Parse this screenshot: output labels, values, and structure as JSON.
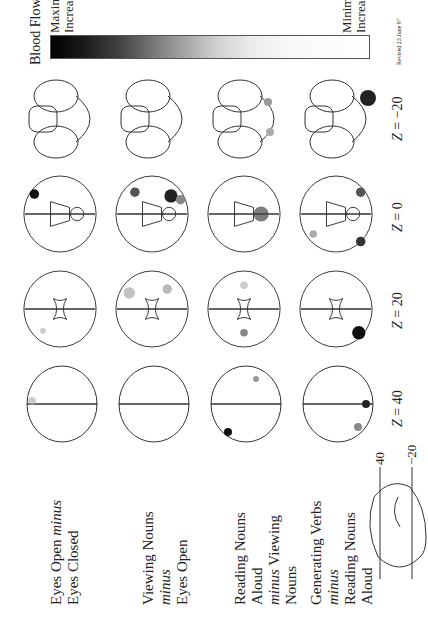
{
  "figure": {
    "orientation": "rotated -90 degrees on page",
    "conditions": [
      {
        "line1": "Eyes Open ",
        "line1_italic": "minus",
        "line2": "Eyes Closed"
      },
      {
        "line1": "Viewing Nouns ",
        "line1_italic": "minus",
        "line2": "Eyes Open"
      },
      {
        "line1": "Reading Nouns Aloud",
        "line1_italic": "",
        "line2_italic": "minus",
        "line2": " Viewing Nouns"
      },
      {
        "line1": "Generating Verbs ",
        "line1_italic": "minus",
        "line2": "Reading Nouns Aloud"
      }
    ],
    "slice_labels": [
      {
        "z": "Z",
        "value": " = 40"
      },
      {
        "z": "Z",
        "value": " = 20"
      },
      {
        "z": "Z",
        "value": " = 0"
      },
      {
        "z": "Z",
        "value": " = −20"
      }
    ],
    "inset": {
      "tick_top": "40",
      "tick_bottom": "−20"
    },
    "legend": {
      "title": "Blood Flow",
      "max_line1": "Maximum",
      "max_line2": "Increase",
      "min_line1": "Minimum",
      "min_line2": "Increase",
      "revised": "Revised 23 June 97"
    }
  }
}
